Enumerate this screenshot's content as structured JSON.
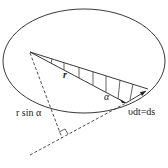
{
  "diagram": {
    "labels": {
      "r": "r",
      "alpha": "α",
      "r_sin_alpha": "r sin α",
      "vdt_ds": "υdt=ds"
    },
    "colors": {
      "stroke": "#222222",
      "background": "#ffffff"
    }
  }
}
